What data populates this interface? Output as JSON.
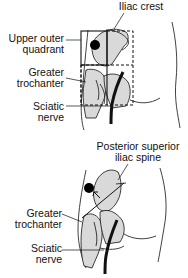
{
  "top_diagram": {
    "labels": {
      "iliac_crest": "Iliac crest",
      "upper_outer_quadrant_1": "Upper outer",
      "upper_outer_quadrant_2": "quadrant",
      "greater_trochanter_1": "Greater",
      "greater_trochanter_2": "trochanter",
      "sciatic_nerve_1": "Sciatic",
      "sciatic_nerve_2": "nerve"
    }
  },
  "bottom_diagram": {
    "labels": {
      "psis_1": "Posterior superior",
      "psis_2": "iliac spine",
      "greater_trochanter_1": "Greater",
      "greater_trochanter_2": "trochanter",
      "sciatic_nerve_1": "Sciatic",
      "sciatic_nerve_2": "nerve"
    }
  },
  "colors": {
    "bone_fill": "#d9d9d9",
    "line": "#111111",
    "injection_site": "#000000"
  }
}
